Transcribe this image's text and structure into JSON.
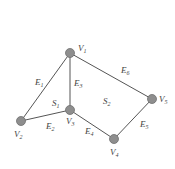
{
  "diagram": {
    "type": "planar-graph",
    "nodes": [
      {
        "id": "V1",
        "name": "V",
        "sub": "1",
        "x": 70,
        "y": 53
      },
      {
        "id": "V2",
        "name": "V",
        "sub": "2",
        "x": 21,
        "y": 121
      },
      {
        "id": "V3",
        "name": "V",
        "sub": "3",
        "x": 70,
        "y": 110
      },
      {
        "id": "V4",
        "name": "V",
        "sub": "4",
        "x": 114,
        "y": 139
      },
      {
        "id": "V5",
        "name": "V",
        "sub": "5",
        "x": 152,
        "y": 99
      }
    ],
    "edges": [
      {
        "id": "E1",
        "name": "E",
        "sub": "1",
        "from": "V1",
        "to": "V2"
      },
      {
        "id": "E2",
        "name": "E",
        "sub": "2",
        "from": "V2",
        "to": "V3"
      },
      {
        "id": "E3",
        "name": "E",
        "sub": "3",
        "from": "V1",
        "to": "V3"
      },
      {
        "id": "E4",
        "name": "E",
        "sub": "4",
        "from": "V3",
        "to": "V4"
      },
      {
        "id": "E5",
        "name": "E",
        "sub": "5",
        "from": "V4",
        "to": "V5"
      },
      {
        "id": "E6",
        "name": "E",
        "sub": "6",
        "from": "V1",
        "to": "V5"
      }
    ],
    "faces": [
      {
        "id": "S1",
        "name": "S",
        "sub": "1"
      },
      {
        "id": "S2",
        "name": "S",
        "sub": "2"
      }
    ]
  }
}
